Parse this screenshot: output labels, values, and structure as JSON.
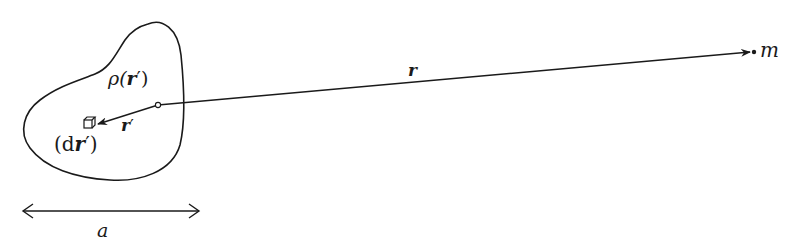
{
  "diagram": {
    "kind": "gravitational potential of extended mass distribution",
    "colors": {
      "stroke": "#1a1a1a",
      "background": "#ffffff"
    },
    "labels": {
      "density": {
        "pre": "ρ(",
        "vec": "r",
        "prime": "′",
        "post": ")"
      },
      "volume_element": {
        "pre": "(d",
        "vec": "r",
        "prime": "′",
        "post": ")"
      },
      "r_prime": {
        "vec": "r",
        "prime": "′"
      },
      "r": {
        "vec": "r"
      },
      "m": "m",
      "a": "a"
    },
    "elements": {
      "body_outline": "closed blob",
      "origin_point": "small circle inside body",
      "cube_icon": "volume element cube",
      "vector_r": "arrow from origin to point mass m",
      "vector_r_prime": "arrow from origin to volume element",
      "size_arrow": "double-headed arrow with length a"
    }
  }
}
